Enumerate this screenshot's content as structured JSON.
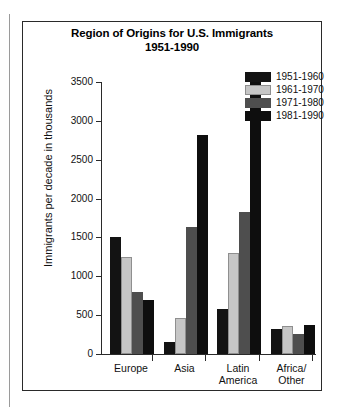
{
  "chart_data": {
    "type": "bar",
    "title": "Region of Origins for U.S. Immigrants 1951-1990",
    "title_line1": "Region of Origins for U.S. Immigrants",
    "title_line2": "1951-1990",
    "xlabel": "",
    "ylabel": "Immigrants per decade in thousands",
    "categories": [
      "Europe",
      "Asia",
      "Latin\nAmerica",
      "Africa/\nOther"
    ],
    "category_labels": [
      "Europe",
      "Asia",
      "Latin America",
      "Africa/Other"
    ],
    "ylim": [
      0,
      3500
    ],
    "yticks": [
      0,
      500,
      1000,
      1500,
      2000,
      2500,
      3000,
      3500
    ],
    "ytick_labels": [
      "0",
      "500",
      "1000",
      "1500",
      "2000",
      "2500",
      "3000",
      "3500"
    ],
    "grid": false,
    "legend_position": "top-right",
    "series": [
      {
        "name": "1951-1960",
        "color": "#131313",
        "values": [
          1500,
          150,
          580,
          320
        ]
      },
      {
        "name": "1961-1970",
        "color": "#c6c6c6",
        "values": [
          1250,
          460,
          1300,
          365
        ]
      },
      {
        "name": "1971-1980",
        "color": "#4e4e4e",
        "values": [
          800,
          1630,
          1830,
          255
        ]
      },
      {
        "name": "1981-1990",
        "color": "#0e0e0e",
        "values": [
          700,
          2820,
          3500,
          370
        ]
      }
    ]
  }
}
